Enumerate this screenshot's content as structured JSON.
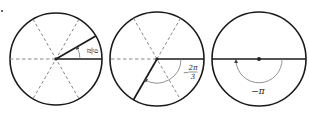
{
  "figure": {
    "marker": "·",
    "panels": [
      {
        "id": "pi-over-6",
        "angle_label": {
          "numerator": "π",
          "denominator": "6"
        },
        "angle_radians": "π/6",
        "direction": "counterclockwise"
      },
      {
        "id": "minus-2pi-over-3",
        "angle_label": {
          "sign": "−",
          "numerator": "2π",
          "denominator": "3"
        },
        "angle_radians": "-2π/3",
        "direction": "clockwise"
      },
      {
        "id": "minus-pi",
        "angle_label": {
          "text": "−π"
        },
        "angle_radians": "-π",
        "direction": "clockwise"
      }
    ],
    "colors": {
      "line": "#1a1a1a",
      "dashed": "#666666",
      "arc": "#777777"
    }
  }
}
